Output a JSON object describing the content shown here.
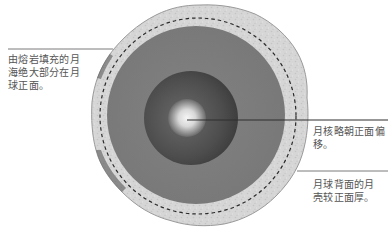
{
  "diagram": {
    "type": "cross-section",
    "colors": {
      "background": "#ffffff",
      "crust": "#d4d4d4",
      "crust_edge": "#9a9a9a",
      "mantle": "#7d7d7d",
      "inner_zone": "#4a4a4a",
      "core_center": "#f2f2f2",
      "core_edge": "#8a8a8a",
      "dashed_line": "#2a2a2a",
      "leader_line": "#666666",
      "label_text": "#555555"
    },
    "layers": [
      {
        "name": "crust",
        "shape": "irregular-ring"
      },
      {
        "name": "dashed-boundary",
        "shape": "dashed-circle"
      },
      {
        "name": "mantle",
        "shape": "disc"
      },
      {
        "name": "inner-zone",
        "shape": "disc"
      },
      {
        "name": "core",
        "shape": "glowing-disc"
      }
    ]
  },
  "labels": {
    "mare": {
      "lines": [
        "由熔岩填充的月",
        "海绝大部分在月",
        "球正面。"
      ]
    },
    "core_offset": {
      "lines": [
        "月核略朝正面偏",
        "移。"
      ]
    },
    "crust_thickness": {
      "lines": [
        "月球背面的月",
        "壳较正面厚。"
      ]
    }
  }
}
